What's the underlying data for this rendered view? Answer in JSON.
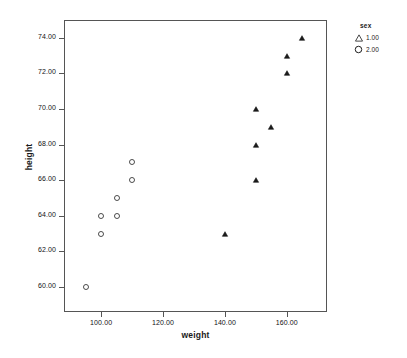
{
  "chart_data": {
    "type": "scatter",
    "title": "",
    "xlabel": "weight",
    "ylabel": "height",
    "xlim": [
      88,
      173
    ],
    "ylim": [
      58.6,
      75.0
    ],
    "xticks": [
      "100.00",
      "120.00",
      "140.00",
      "160.00"
    ],
    "xtick_values": [
      100,
      120,
      140,
      160
    ],
    "yticks": [
      "60.00",
      "62.00",
      "64.00",
      "66.00",
      "68.00",
      "70.00",
      "72.00",
      "74.00"
    ],
    "ytick_values": [
      60,
      62,
      64,
      66,
      68,
      70,
      72,
      74
    ],
    "grid": false,
    "legend_position": "right",
    "legend_title": "sex",
    "series": [
      {
        "name": "1.00",
        "marker": "triangle",
        "color": "#1a1a1a",
        "points": [
          {
            "x": 140,
            "y": 63
          },
          {
            "x": 150,
            "y": 66
          },
          {
            "x": 150,
            "y": 68
          },
          {
            "x": 150,
            "y": 70
          },
          {
            "x": 155,
            "y": 69
          },
          {
            "x": 160,
            "y": 72
          },
          {
            "x": 160,
            "y": 73
          },
          {
            "x": 165,
            "y": 74
          }
        ]
      },
      {
        "name": "2.00",
        "marker": "circle",
        "color": "#1a1a1a",
        "points": [
          {
            "x": 95,
            "y": 60
          },
          {
            "x": 100,
            "y": 63
          },
          {
            "x": 100,
            "y": 64
          },
          {
            "x": 105,
            "y": 64
          },
          {
            "x": 105,
            "y": 65
          },
          {
            "x": 110,
            "y": 66
          },
          {
            "x": 110,
            "y": 67
          }
        ]
      }
    ]
  },
  "legend": {
    "title": "sex",
    "entries": [
      {
        "label": "1.00",
        "marker": "triangle-marker-icon"
      },
      {
        "label": "2.00",
        "marker": "circle-marker-icon"
      }
    ]
  },
  "axes": {
    "x_title": "weight",
    "y_title": "height"
  }
}
